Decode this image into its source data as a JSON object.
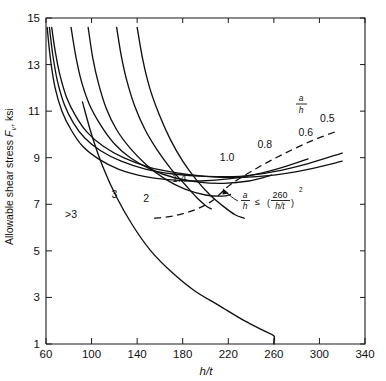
{
  "chart_data": {
    "type": "line",
    "title": "",
    "xlabel": "h/t",
    "ylabel": "Allowable shear stress F_v, ksi",
    "ylabel_main": "Allowable shear stress",
    "ylabel_symbol": "F",
    "ylabel_subscript": "v",
    "ylabel_units": ", ksi",
    "xlim": [
      60,
      340
    ],
    "ylim": [
      1,
      15
    ],
    "xticks": [
      60,
      100,
      140,
      180,
      220,
      260,
      300,
      340
    ],
    "yticks": [
      1,
      3,
      5,
      7,
      9,
      11,
      13,
      15
    ],
    "grid": false,
    "legend_position": "inline-curve-labels",
    "legend_title_numerator": "a",
    "legend_title_denominator": "h",
    "annotation": {
      "text": "a/h ≤ (260/(h/t))²",
      "numerator": "a",
      "denominator": "h",
      "relation": "≤",
      "frac_numerator": "260",
      "frac_denominator": "h/t",
      "exponent": "2",
      "target_x": 222,
      "target_y": 7.85
    },
    "series": [
      {
        "name": "0.5",
        "label": "0.5",
        "label_x": 307,
        "label_y": 10.55,
        "points": [
          [
            65,
            14.6
          ],
          [
            68,
            13.6
          ],
          [
            72,
            12.6
          ],
          [
            78,
            11.6
          ],
          [
            86,
            10.8
          ],
          [
            96,
            10.1
          ],
          [
            110,
            9.5
          ],
          [
            128,
            9.0
          ],
          [
            150,
            8.6
          ],
          [
            175,
            8.35
          ],
          [
            200,
            8.2
          ],
          [
            230,
            8.15
          ],
          [
            260,
            8.25
          ],
          [
            290,
            8.5
          ],
          [
            320,
            8.85
          ]
        ],
        "note": "topmost family curve group"
      },
      {
        "name": "0.6",
        "label": "0.6",
        "label_x": 288,
        "label_y": 9.95,
        "points": [
          [
            63,
            14.6
          ],
          [
            66,
            13.4
          ],
          [
            70,
            12.3
          ],
          [
            76,
            11.3
          ],
          [
            84,
            10.5
          ],
          [
            94,
            9.85
          ],
          [
            108,
            9.3
          ],
          [
            126,
            8.85
          ],
          [
            148,
            8.5
          ],
          [
            172,
            8.3
          ],
          [
            200,
            8.2
          ],
          [
            230,
            8.2
          ],
          [
            260,
            8.4
          ],
          [
            290,
            8.75
          ],
          [
            320,
            9.2
          ]
        ]
      },
      {
        "name": "0.8",
        "label": "0.8",
        "label_x": 252,
        "label_y": 9.4,
        "points": [
          [
            61,
            14.6
          ],
          [
            64,
            13.2
          ],
          [
            68,
            12.0
          ],
          [
            74,
            11.0
          ],
          [
            82,
            10.2
          ],
          [
            92,
            9.5
          ],
          [
            106,
            8.95
          ],
          [
            124,
            8.5
          ],
          [
            146,
            8.2
          ],
          [
            170,
            8.05
          ],
          [
            196,
            8.0
          ],
          [
            222,
            8.1
          ],
          [
            250,
            8.35
          ],
          [
            275,
            8.7
          ],
          [
            290,
            8.95
          ]
        ]
      },
      {
        "name": "1.0",
        "label": "1.0",
        "label_x": 219,
        "label_y": 8.85,
        "points": [
          [
            82,
            14.6
          ],
          [
            86,
            13.4
          ],
          [
            91,
            12.3
          ],
          [
            98,
            11.3
          ],
          [
            108,
            10.4
          ],
          [
            120,
            9.6
          ],
          [
            134,
            9.0
          ],
          [
            152,
            8.5
          ],
          [
            172,
            8.15
          ],
          [
            194,
            7.95
          ],
          [
            216,
            7.9
          ],
          [
            238,
            8.0
          ],
          [
            258,
            8.25
          ]
        ]
      },
      {
        "name": "1.4",
        "label": "1.4",
        "label_x": 177,
        "label_y": 7.95,
        "points": [
          [
            97,
            14.6
          ],
          [
            101,
            13.3
          ],
          [
            106,
            12.2
          ],
          [
            113,
            11.1
          ],
          [
            122,
            10.2
          ],
          [
            134,
            9.4
          ],
          [
            148,
            8.7
          ],
          [
            164,
            8.1
          ],
          [
            182,
            7.65
          ],
          [
            200,
            7.4
          ],
          [
            215,
            7.35
          ],
          [
            222,
            7.42
          ]
        ]
      },
      {
        "name": "2",
        "label": "2",
        "label_x": 148,
        "label_y": 7.1,
        "points": [
          [
            122,
            14.6
          ],
          [
            126,
            13.4
          ],
          [
            131,
            12.3
          ],
          [
            138,
            11.2
          ],
          [
            147,
            10.2
          ],
          [
            158,
            9.3
          ],
          [
            170,
            8.5
          ],
          [
            182,
            7.85
          ],
          [
            192,
            7.3
          ],
          [
            200,
            6.95
          ],
          [
            205,
            6.8
          ]
        ]
      },
      {
        "name": "3",
        "label": "3",
        "label_x": 120,
        "label_y": 7.25,
        "points": [
          [
            140,
            14.6
          ],
          [
            145,
            13.2
          ],
          [
            151,
            12.0
          ],
          [
            159,
            10.9
          ],
          [
            169,
            9.8
          ],
          [
            180,
            8.85
          ],
          [
            192,
            8.05
          ],
          [
            204,
            7.4
          ],
          [
            216,
            6.9
          ],
          [
            226,
            6.55
          ],
          [
            234,
            6.4
          ]
        ]
      },
      {
        "name": ">3",
        "label": ">3",
        "label_x": 82,
        "label_y": 6.4,
        "points": [
          [
            92,
            11.4
          ],
          [
            100,
            10.0
          ],
          [
            110,
            8.6
          ],
          [
            122,
            7.3
          ],
          [
            136,
            6.1
          ],
          [
            152,
            5.0
          ],
          [
            170,
            4.1
          ],
          [
            190,
            3.3
          ],
          [
            212,
            2.65
          ],
          [
            234,
            2.0
          ],
          [
            252,
            1.55
          ],
          [
            260,
            1.35
          ],
          [
            260,
            1.0
          ]
        ]
      }
    ],
    "boundary_curve": {
      "name": "a/h limit boundary",
      "style": "dashed",
      "points": [
        [
          155,
          6.4
        ],
        [
          172,
          6.5
        ],
        [
          190,
          6.75
        ],
        [
          206,
          7.15
        ],
        [
          222,
          7.85
        ],
        [
          245,
          8.55
        ],
        [
          268,
          9.15
        ],
        [
          292,
          9.7
        ],
        [
          316,
          10.15
        ]
      ]
    }
  }
}
